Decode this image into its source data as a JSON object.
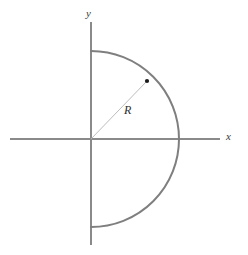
{
  "figure": {
    "width": 248,
    "height": 255,
    "background_color": "#ffffff"
  },
  "axes": {
    "x_axis": {
      "label": "x",
      "color": "#8a8a8a",
      "y_position": 139,
      "x_start": 10,
      "x_end": 220,
      "stroke_width": 1.6
    },
    "y_axis": {
      "label": "y",
      "color": "#8a8a8a",
      "x_position": 91,
      "y_start": 22,
      "y_end": 245,
      "stroke_width": 1.6
    },
    "origin": {
      "x": 91,
      "y": 139
    }
  },
  "semicircle": {
    "radius": 88,
    "center": {
      "x": 91,
      "y": 139
    },
    "orientation": "right-half",
    "top_point": {
      "x": 91,
      "y": 51
    },
    "bottom_point": {
      "x": 91,
      "y": 227
    },
    "rightmost_point": {
      "x": 179,
      "y": 139
    },
    "color": "#7f7f7f",
    "stroke_width": 2.0
  },
  "radius_indicator": {
    "label": "R",
    "label_position": {
      "x": 124,
      "y": 104
    },
    "line_from": {
      "x": 91,
      "y": 139
    },
    "line_to": {
      "x": 147,
      "y": 81
    },
    "line_color": "#b4b4b4",
    "line_stroke_width": 0.9,
    "endpoint_dot": {
      "x": 147,
      "y": 81,
      "radius": 2.1,
      "color": "#1a1a1a"
    }
  },
  "colors": {
    "arc": "#7f7f7f",
    "axis": "#8a8a8a",
    "radius_line": "#b4b4b4",
    "dot": "#1a1a1a",
    "text": "#2e2e2e",
    "background": "#ffffff"
  }
}
